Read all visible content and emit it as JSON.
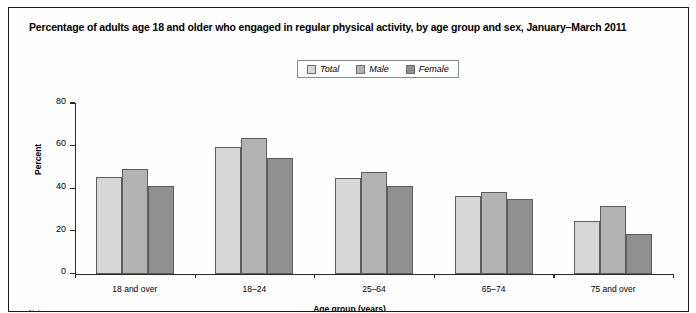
{
  "chart_data": {
    "type": "bar",
    "title": "Percentage of adults age 18 and older who engaged in regular physical activity, by age group and sex, January–March 2011",
    "xlabel": "Age group (years)",
    "ylabel": "Percent",
    "categories": [
      "18 and over",
      "18–24",
      "25–64",
      "65–74",
      "75 and over"
    ],
    "series": [
      {
        "name": "Total",
        "values": [
          45.5,
          59.5,
          45.0,
          36.5,
          25.0
        ],
        "color": "#d7d7d7"
      },
      {
        "name": "Male",
        "values": [
          49.5,
          64.0,
          48.0,
          38.5,
          32.0
        ],
        "color": "#b3b3b3"
      },
      {
        "name": "Female",
        "values": [
          41.5,
          54.5,
          41.5,
          35.0,
          19.0
        ],
        "color": "#8f8f8f"
      }
    ],
    "ylim": [
      0,
      80
    ],
    "yticks": [
      0,
      20,
      40,
      60,
      80
    ],
    "ytick_labels": [
      "0",
      "20",
      "40",
      "60",
      "80"
    ],
    "grid": false,
    "legend_position": "top-center"
  },
  "footnote": "Note:"
}
